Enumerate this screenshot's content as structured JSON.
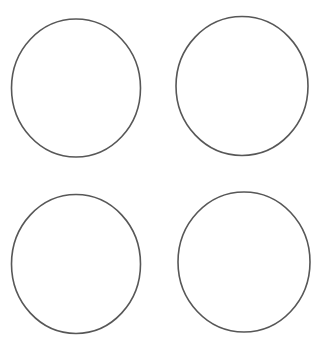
{
  "canvas": {
    "width": 329,
    "height": 354,
    "background": "#ffffff"
  },
  "stroke": {
    "color": "#3a3a3a",
    "width": 1.6
  },
  "circles": [
    {
      "id": "top-left",
      "cx": 76,
      "cy": 88,
      "rx": 64.5,
      "ry": 69
    },
    {
      "id": "top-right",
      "cx": 242,
      "cy": 86,
      "rx": 66,
      "ry": 69.5
    },
    {
      "id": "bottom-left",
      "cx": 76,
      "cy": 264,
      "rx": 64.5,
      "ry": 69.5
    },
    {
      "id": "bottom-right",
      "cx": 244,
      "cy": 262,
      "rx": 66,
      "ry": 70
    }
  ]
}
